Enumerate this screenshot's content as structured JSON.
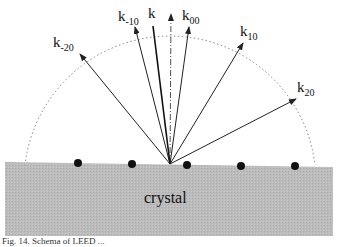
{
  "diagram": {
    "type": "LEED scattering schematic",
    "crystal_label": "crystal",
    "incident_label": "k",
    "beams": [
      {
        "label": "k",
        "sub": "-20"
      },
      {
        "label": "k",
        "sub": "-10"
      },
      {
        "label": "k",
        "sub": "00"
      },
      {
        "label": "k",
        "sub": "10"
      },
      {
        "label": "k",
        "sub": "20"
      }
    ],
    "atom_count": 5,
    "colors": {
      "crystal_fill": "#bdbdbd",
      "lines": "#222222",
      "atoms": "#111111"
    }
  },
  "caption": "Fig. 14.   Schema of LEED ..."
}
